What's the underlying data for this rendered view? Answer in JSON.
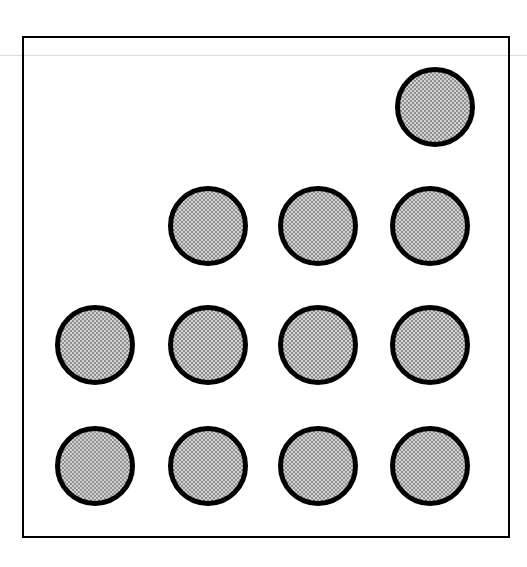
{
  "figure": {
    "canvas": {
      "width": 527,
      "height": 567,
      "background": "#ffffff"
    },
    "frame": {
      "name": "figure border rectangle",
      "x": 22,
      "y": 36,
      "width": 488,
      "height": 502,
      "stroke_color": "#000000",
      "stroke_width": 2,
      "fill": "none"
    },
    "scan_rule": {
      "name": "faint horizontal ruling line",
      "y": 55,
      "color": "#dcdcdc",
      "thickness": 1
    },
    "dot_style": {
      "diameter": 80,
      "stroke_color": "#000000",
      "stroke_width": 5,
      "fill_color": "#d2d2d2",
      "fill_pattern": "halftone-checker-dots"
    },
    "counts": {
      "total_dots": 12,
      "rows": 4,
      "columns": 4,
      "dots_per_row": [
        1,
        3,
        4,
        4
      ]
    }
  },
  "chart_data": {
    "type": "scatter",
    "subtitle": "",
    "xlabel": "",
    "ylabel": "",
    "grid": false,
    "legend": null,
    "marker": {
      "shape": "circle",
      "diameter_px": 80,
      "facecolor": "#d2d2d2",
      "edgecolor": "#000000",
      "edgewidth_px": 5,
      "hatch": "halftone dots"
    },
    "axis_frame": {
      "x0": 22,
      "y0": 36,
      "x1": 510,
      "y1": 538
    },
    "column_positions_px": [
      55,
      168,
      278,
      390
    ],
    "row_positions_px": [
      67,
      186,
      305,
      426
    ],
    "grid_occupancy": [
      [
        0,
        0,
        0,
        1
      ],
      [
        0,
        1,
        1,
        1
      ],
      [
        1,
        1,
        1,
        1
      ],
      [
        1,
        1,
        1,
        1
      ]
    ],
    "points": [
      {
        "id": "dot-r1c4",
        "row": 1,
        "col": 4,
        "x": 435,
        "y": 107,
        "left": 395,
        "top": 67
      },
      {
        "id": "dot-r2c2",
        "row": 2,
        "col": 2,
        "x": 208,
        "y": 226,
        "left": 168,
        "top": 186
      },
      {
        "id": "dot-r2c3",
        "row": 2,
        "col": 3,
        "x": 318,
        "y": 226,
        "left": 278,
        "top": 186
      },
      {
        "id": "dot-r2c4",
        "row": 2,
        "col": 4,
        "x": 430,
        "y": 226,
        "left": 390,
        "top": 186
      },
      {
        "id": "dot-r3c1",
        "row": 3,
        "col": 1,
        "x": 95,
        "y": 345,
        "left": 55,
        "top": 305
      },
      {
        "id": "dot-r3c2",
        "row": 3,
        "col": 2,
        "x": 208,
        "y": 345,
        "left": 168,
        "top": 305
      },
      {
        "id": "dot-r3c3",
        "row": 3,
        "col": 3,
        "x": 318,
        "y": 345,
        "left": 278,
        "top": 305
      },
      {
        "id": "dot-r3c4",
        "row": 3,
        "col": 4,
        "x": 430,
        "y": 345,
        "left": 390,
        "top": 305
      },
      {
        "id": "dot-r4c1",
        "row": 4,
        "col": 1,
        "x": 95,
        "y": 466,
        "left": 55,
        "top": 426
      },
      {
        "id": "dot-r4c2",
        "row": 4,
        "col": 2,
        "x": 208,
        "y": 466,
        "left": 168,
        "top": 426
      },
      {
        "id": "dot-r4c3",
        "row": 4,
        "col": 3,
        "x": 318,
        "y": 466,
        "left": 278,
        "top": 426
      },
      {
        "id": "dot-r4c4",
        "row": 4,
        "col": 4,
        "x": 430,
        "y": 466,
        "left": 390,
        "top": 426
      }
    ]
  }
}
